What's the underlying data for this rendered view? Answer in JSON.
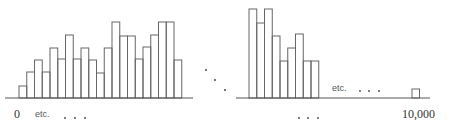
{
  "chart_data": {
    "type": "bar",
    "title": "",
    "xlabel": "",
    "ylabel": "",
    "grid": false,
    "legend": null,
    "segments": [
      {
        "name": "start",
        "start_label": "0",
        "annotation": "etc.",
        "ellipsis": "· · ·",
        "relative_heights": [
          12,
          26,
          38,
          26,
          50,
          39,
          63,
          39,
          50,
          38,
          25,
          50,
          76,
          62,
          62,
          39,
          51,
          63,
          76,
          76,
          38
        ]
      },
      {
        "name": "middle",
        "ellipsis": "· · ·",
        "relative_heights": [
          89,
          75,
          89,
          62,
          37,
          50,
          64,
          37,
          37
        ]
      },
      {
        "name": "end",
        "annotation": "etc.",
        "ellipsis": "· · ·",
        "end_label": "10,000",
        "relative_heights": [
          9
        ]
      }
    ],
    "axis_break": "· · ·",
    "tick_labels": [
      "0",
      "10,000"
    ]
  },
  "labels": {
    "zero": "0",
    "ten_thousand": "10,000",
    "etc_left": "etc.",
    "etc_right": "etc."
  }
}
